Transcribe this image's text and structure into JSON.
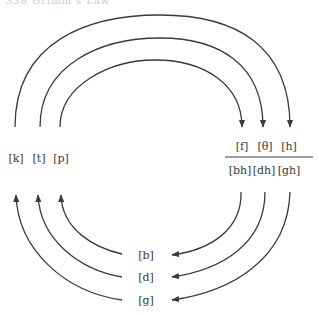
{
  "header": {
    "text": "338 Grimm's Law"
  },
  "diagram": {
    "left_group": [
      "[k]",
      "[t]",
      "[p]"
    ],
    "right_top_group": [
      "[f]",
      "[θ]",
      "[h]"
    ],
    "right_bottom_group": [
      "[bh]",
      "[dh]",
      "[gh]"
    ],
    "bottom_group": [
      "[b]",
      "[d]",
      "[g]"
    ],
    "arrows": [
      {
        "from": "[p]",
        "to": "[f]"
      },
      {
        "from": "[t]",
        "to": "[θ]"
      },
      {
        "from": "[k]",
        "to": "[h]"
      },
      {
        "from": "[bh]",
        "to": "[b]"
      },
      {
        "from": "[dh]",
        "to": "[d]"
      },
      {
        "from": "[gh]",
        "to": "[g]"
      },
      {
        "from": "[b]",
        "to": "[p]"
      },
      {
        "from": "[d]",
        "to": "[t]"
      },
      {
        "from": "[g]",
        "to": "[k]"
      }
    ],
    "line_color": "#3a3a3a"
  }
}
